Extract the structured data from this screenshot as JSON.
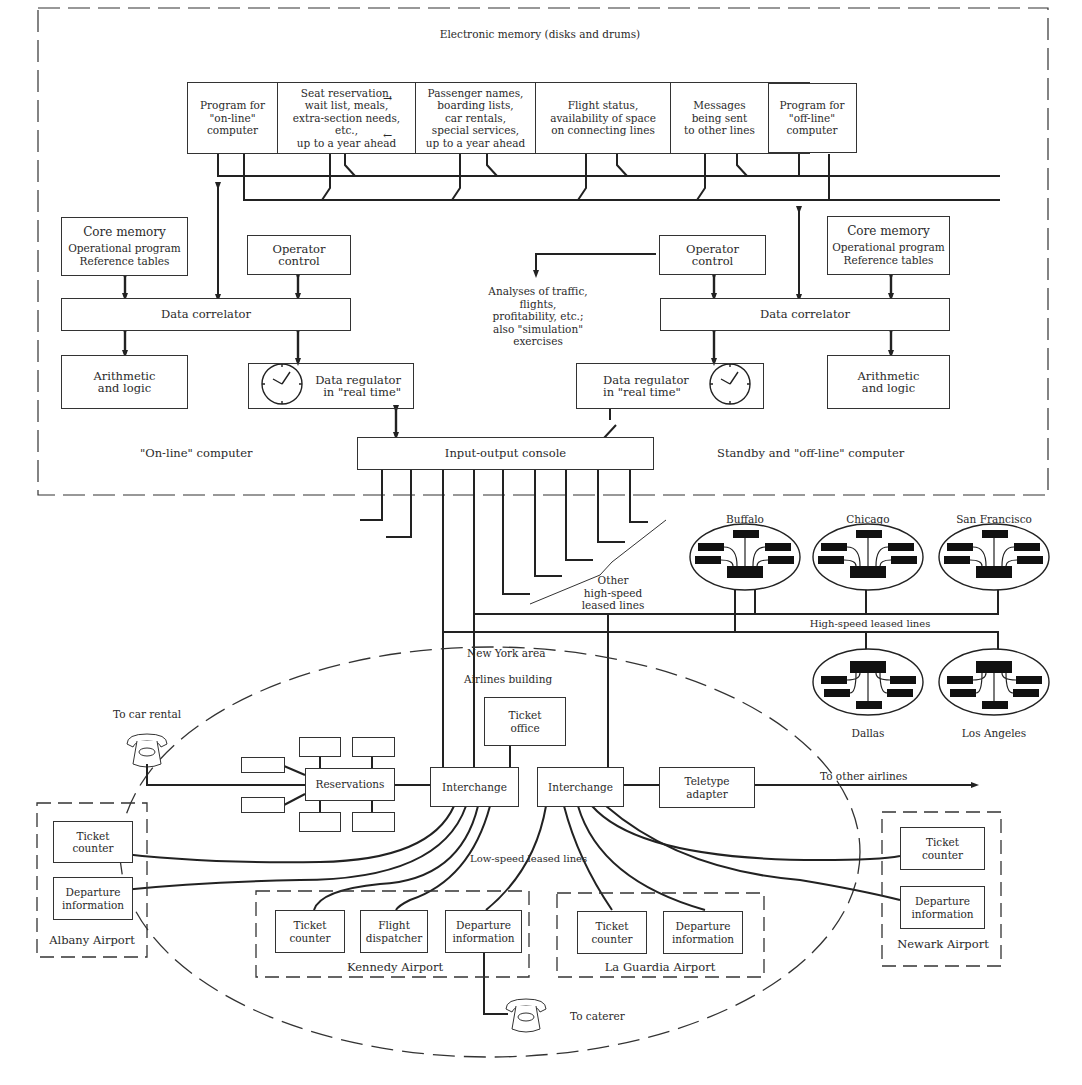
{
  "title": "Electronic memory (disks and drums)",
  "memory_cells": [
    {
      "id": "online-program",
      "lines": [
        "Program for",
        "\"on-line\"",
        "computer"
      ]
    },
    {
      "id": "seat-reservation",
      "lines": [
        "Seat reservation,",
        "wait list, meals,",
        "extra-section needs,",
        "etc.,",
        "up to a year ahead"
      ]
    },
    {
      "id": "passenger-names",
      "lines": [
        "Passenger names,",
        "boarding lists,",
        "car rentals,",
        "special services,",
        "up to a year ahead"
      ]
    },
    {
      "id": "flight-status",
      "lines": [
        "Flight status,",
        "availability of space",
        "on connecting lines"
      ]
    },
    {
      "id": "messages",
      "lines": [
        "Messages",
        "being sent",
        "to other lines"
      ]
    },
    {
      "id": "offline-program",
      "lines": [
        "Program for",
        "\"off-line\"",
        "computer"
      ]
    }
  ],
  "online_computer": {
    "label": "\"On-line\" computer",
    "core_memory": {
      "title": "Core memory",
      "lines": [
        "Operational program",
        "Reference tables"
      ]
    },
    "operator_control": {
      "lines": [
        "Operator",
        "control"
      ]
    },
    "data_correlator": "Data correlator",
    "arithmetic": {
      "lines": [
        "Arithmetic",
        "and logic"
      ]
    },
    "data_regulator": {
      "lines": [
        "Data regulator",
        "in \"real time\""
      ]
    }
  },
  "offline_computer": {
    "label": "Standby and \"off-line\" computer",
    "core_memory": {
      "title": "Core memory",
      "lines": [
        "Operational program",
        "Reference tables"
      ]
    },
    "operator_control": {
      "lines": [
        "Operator",
        "control"
      ]
    },
    "data_correlator": "Data correlator",
    "arithmetic": {
      "lines": [
        "Arithmetic",
        "and logic"
      ]
    },
    "data_regulator": {
      "lines": [
        "Data regulator",
        "in \"real time\""
      ]
    }
  },
  "analyses": {
    "lines": [
      "Analyses of traffic,",
      "flights,",
      "profitability, etc.;",
      "also \"simulation\"",
      "exercises"
    ]
  },
  "io_console": "Input-output console",
  "other_lines": {
    "lines": [
      "Other",
      "high-speed",
      "leased lines"
    ]
  },
  "cities": {
    "top": [
      "Buffalo",
      "Chicago",
      "San Francisco"
    ],
    "bottom": [
      "Dallas",
      "Los Angeles"
    ]
  },
  "high_speed_label": "High-speed leased lines",
  "new_york_area": "New York area",
  "airlines_building": "Airlines building",
  "ticket_office": {
    "lines": [
      "Ticket",
      "office"
    ]
  },
  "to_car_rental": "To car rental",
  "reservations": "Reservations",
  "interchange_left": "Interchange",
  "interchange_right": "Interchange",
  "teletype_adapter": {
    "lines": [
      "Teletype",
      "adapter"
    ]
  },
  "to_other_airlines": "To other airlines",
  "low_speed_label": "Low-speed leased lines",
  "airports": {
    "albany": {
      "name": "Albany Airport",
      "units": [
        {
          "lines": [
            "Ticket",
            "counter"
          ]
        },
        {
          "lines": [
            "Departure",
            "information"
          ]
        }
      ]
    },
    "kennedy": {
      "name": "Kennedy Airport",
      "units": [
        {
          "lines": [
            "Ticket",
            "counter"
          ]
        },
        {
          "lines": [
            "Flight",
            "dispatcher"
          ]
        },
        {
          "lines": [
            "Departure",
            "information"
          ]
        }
      ]
    },
    "laguardia": {
      "name": "La Guardia Airport",
      "units": [
        {
          "lines": [
            "Ticket",
            "counter"
          ]
        },
        {
          "lines": [
            "Departure",
            "information"
          ]
        }
      ]
    },
    "newark": {
      "name": "Newark Airport",
      "units": [
        {
          "lines": [
            "Ticket",
            "counter"
          ]
        },
        {
          "lines": [
            "Departure",
            "information"
          ]
        }
      ]
    }
  },
  "to_caterer": "To caterer",
  "colors": {
    "ink": "#2a2a2a",
    "paper": "#ffffff"
  }
}
